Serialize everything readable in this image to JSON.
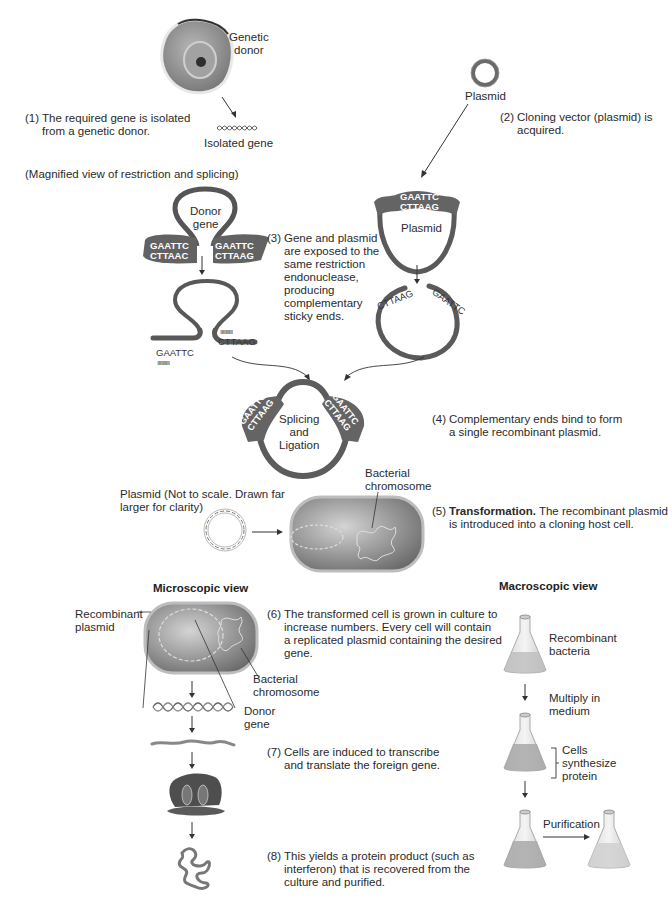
{
  "figure": {
    "labels": {
      "genetic_donor": "Genetic\ndonor",
      "isolated_gene": "Isolated gene",
      "plasmid_top": "Plasmid",
      "magnified_view": "(Magnified view of restriction and splicing)",
      "donor_gene": "Donor\ngene",
      "plasmid_cut": "Plasmid",
      "splicing": "Splicing\nand\nLigation",
      "bacterial_chromosome_1": "Bacterial\nchromosome",
      "plasmid_not_to_scale": "Plasmid (Not to scale. Drawn far\nlarger for clarity)",
      "recombinant_plasmid": "Recombinant\nplasmid",
      "bacterial_chromosome_2": "Bacterial\nchromosome",
      "donor_gene_2": "Donor\ngene",
      "recombinant_bacteria": "Recombinant\nbacteria",
      "multiply": "Multiply in\nmedium",
      "cells_synthesize": "Cells\nsynthesize\nprotein",
      "purification": "Purification"
    },
    "sequences": {
      "donor_left_top": "GAATTC",
      "donor_left_bottom": "CTTAAC",
      "donor_right_top": "GAATTC",
      "donor_right_bottom": "CTTAAG",
      "cut_left": "GAATTC",
      "cut_right": "CTTAAG",
      "plasmid_top": "GAATTC",
      "plasmid_bottom": "CTTAAG",
      "plasmid_cut_left": "CTTAAG",
      "plasmid_cut_right": "GAATTC",
      "recomb_left_top": "GAATTC",
      "recomb_left_bottom": "CTTAAG",
      "recomb_right_top": "GAATTC",
      "recomb_right_bottom": "CTTAAG"
    },
    "sections": {
      "microscopic": "Microscopic view",
      "macroscopic": "Macroscopic view"
    },
    "steps": [
      {
        "num": "(1)",
        "text": "The required gene is isolated\nfrom a genetic donor."
      },
      {
        "num": "(2)",
        "text": "Cloning vector (plasmid) is\nacquired."
      },
      {
        "num": "(3)",
        "text": "Gene and plasmid\nare exposed to the\nsame restriction\nendonuclease,\nproducing\ncomplementary\nsticky ends."
      },
      {
        "num": "(4)",
        "text": "Complementary ends bind to form\na single recombinant plasmid."
      },
      {
        "num": "(5)",
        "bold": "Transformation.",
        "text": " The recombinant plasmid\nis introduced into a cloning host cell."
      },
      {
        "num": "(6)",
        "text": "The transformed cell is grown in culture to\nincrease numbers. Every cell will contain\na replicated plasmid containing the desired\ngene."
      },
      {
        "num": "(7)",
        "text": "Cells are induced to transcribe\nand translate the foreign gene."
      },
      {
        "num": "(8)",
        "text": "This yields a protein product (such as\ninterferon) that is recovered from the\nculture and purified."
      }
    ],
    "colors": {
      "dna_strand": "#5e5e5e",
      "strand_dark": "#4a4a4a",
      "cell_fill": "#9a9a9a",
      "text": "#2b2b2b"
    }
  }
}
